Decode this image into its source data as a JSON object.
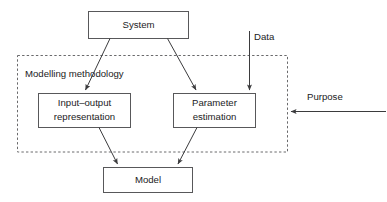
{
  "diagram": {
    "background_color": "#ffffff",
    "line_color": "#3b3b3d",
    "box_stroke_color": "#58585a",
    "text_color": "#1b1b1d",
    "group": {
      "label": "Modelling methodology",
      "border_style": "dashed"
    },
    "nodes": [
      {
        "id": "system",
        "label": "System",
        "shape": "rectangle"
      },
      {
        "id": "input",
        "label_line1": "Input–output",
        "label_line2": "representation",
        "shape": "rectangle"
      },
      {
        "id": "parameter",
        "label_line1": "Parameter",
        "label_line2": "estimation",
        "shape": "rectangle"
      },
      {
        "id": "model",
        "label": "Model",
        "shape": "rectangle"
      }
    ],
    "external_labels": [
      {
        "id": "data",
        "label": "Data",
        "arrow": "down"
      },
      {
        "id": "purpose",
        "label": "Purpose",
        "arrow": "left"
      }
    ],
    "edges": [
      {
        "from": "system",
        "to": "input",
        "arrowhead": true
      },
      {
        "from": "system",
        "to": "parameter",
        "arrowhead": true
      },
      {
        "from": "data",
        "to": "parameter",
        "arrowhead": true
      },
      {
        "from": "input",
        "to": "model",
        "arrowhead": true
      },
      {
        "from": "parameter",
        "to": "model",
        "arrowhead": true
      },
      {
        "from": "purpose",
        "to": "group",
        "arrowhead": true
      }
    ]
  }
}
